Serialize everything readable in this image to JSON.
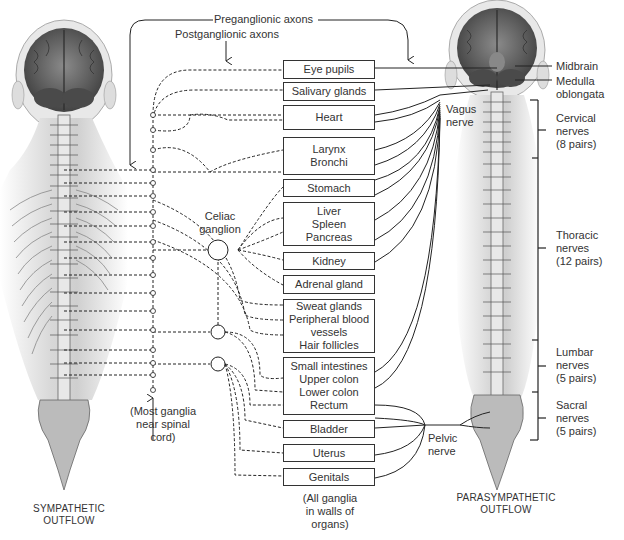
{
  "top_labels": {
    "preganglionic": "Preganglionic axons",
    "postganglionic": "Postganglionic axons"
  },
  "organs": [
    {
      "id": "eye-pupils",
      "label": "Eye pupils"
    },
    {
      "id": "salivary-glands",
      "label": "Salivary glands"
    },
    {
      "id": "heart",
      "label": "Heart"
    },
    {
      "id": "larynx-bronchi",
      "label": "Larynx\nBronchi"
    },
    {
      "id": "stomach",
      "label": "Stomach"
    },
    {
      "id": "liver-spleen-pancreas",
      "label": "Liver\nSpleen\nPancreas"
    },
    {
      "id": "kidney",
      "label": "Kidney"
    },
    {
      "id": "adrenal-gland",
      "label": "Adrenal gland"
    },
    {
      "id": "sweat-glands",
      "label": "Sweat glands\nPeripheral blood\nvessels\nHair follicles"
    },
    {
      "id": "intestines",
      "label": "Small intestines\nUpper colon\nLower colon\nRectum"
    },
    {
      "id": "bladder",
      "label": "Bladder"
    },
    {
      "id": "uterus",
      "label": "Uterus"
    },
    {
      "id": "genitals",
      "label": "Genitals"
    }
  ],
  "ganglia": {
    "celiac": "Celiac\nganglion",
    "sympathetic_note": "(Most ganglia\nnear spinal\ncord)",
    "parasympathetic_note": "(All ganglia\nin walls of\norgans)"
  },
  "nerves": {
    "vagus": "Vagus\nnerve",
    "pelvic": "Pelvic\nnerve"
  },
  "brain_regions": {
    "midbrain": "Midbrain",
    "medulla": "Medulla\noblongata"
  },
  "spinal_regions": [
    {
      "id": "cervical",
      "label": "Cervical\nnerves\n(8 pairs)"
    },
    {
      "id": "thoracic",
      "label": "Thoracic\nnerves\n(12 pairs)"
    },
    {
      "id": "lumbar",
      "label": "Lumbar\nnerves\n(5 pairs)"
    },
    {
      "id": "sacral",
      "label": "Sacral\nnerves\n(5 pairs)"
    }
  ],
  "captions": {
    "sympathetic": "SYMPATHETIC\nOUTFLOW",
    "parasympathetic": "PARASYMPATHETIC\nOUTFLOW"
  }
}
